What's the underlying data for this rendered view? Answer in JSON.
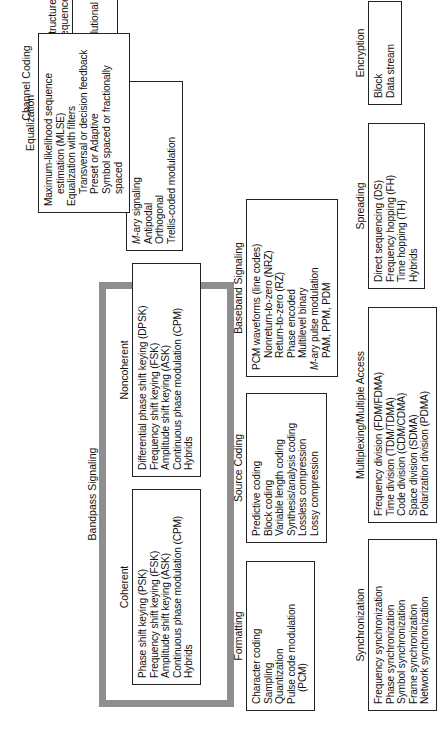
{
  "diagram": {
    "orientation": "rotated-90-ccw",
    "frame_color": "#8e8e8e",
    "box_border_color": "#222222",
    "background": "#ffffff",
    "groups": [
      {
        "id": "bandpass",
        "label": "Bandpass Signaling",
        "highlighted": true
      },
      {
        "id": "channel_coding",
        "label": "Channel Coding",
        "highlighted": false
      }
    ]
  },
  "sections": {
    "formatting": {
      "title": "Formatting",
      "items": [
        {
          "text": "Character coding",
          "indent": false
        },
        {
          "text": "Sampling",
          "indent": false
        },
        {
          "text": "Quantization",
          "indent": false
        },
        {
          "text": "Pulse code modulation",
          "indent": false
        },
        {
          "text": "(PCM)",
          "indent": true
        }
      ]
    },
    "source_coding": {
      "title": "Source Coding",
      "items": [
        {
          "text": "Predictive coding",
          "indent": false
        },
        {
          "text": "Block coding",
          "indent": false
        },
        {
          "text": "Variable length coding",
          "indent": false
        },
        {
          "text": "Synthesis/analysis coding",
          "indent": false
        },
        {
          "text": "Lossless compression",
          "indent": false
        },
        {
          "text": "Lossy compression",
          "indent": false
        }
      ]
    },
    "baseband_signaling": {
      "title": "Baseband Signaling",
      "items": [
        {
          "text": "PCM waveforms (line codes)",
          "indent": false
        },
        {
          "text": "Nonreturn-to-zero (NRZ)",
          "indent": true
        },
        {
          "text": "Return-to-zero (RZ)",
          "indent": true
        },
        {
          "text": "Phase encoded",
          "indent": true
        },
        {
          "text": "Multilevel binary",
          "indent": true
        },
        {
          "text": "M-ary pulse modulation",
          "indent": false,
          "italic_lead": "M"
        },
        {
          "text": "PAM, PPM, PDM",
          "indent": true
        }
      ]
    },
    "equalization": {
      "title": "Equalization",
      "items": [
        {
          "text": "Maximum-likelihood sequence",
          "indent": false
        },
        {
          "text": "estimation (MLSE)",
          "indent": true
        },
        {
          "text": "Equalization with filters",
          "indent": false
        },
        {
          "text": "Transversal or decision feedback",
          "indent": true
        },
        {
          "text": "Preset or Adaptive",
          "indent": true
        },
        {
          "text": "Symbol spaced or fractionally",
          "indent": true
        },
        {
          "text": "spaced",
          "indent": true
        }
      ]
    },
    "coherent": {
      "title": "Coherent",
      "items": [
        {
          "text": "Phase shift keying (PSK)",
          "indent": false
        },
        {
          "text": "Frequency shift keying (FSK)",
          "indent": false
        },
        {
          "text": "Amplitude shift keying (ASK)",
          "indent": false
        },
        {
          "text": "Continuous phase modulation (CPM)",
          "indent": false
        },
        {
          "text": "Hybrids",
          "indent": false
        }
      ]
    },
    "noncoherent": {
      "title": "Noncoherent",
      "items": [
        {
          "text": "Differential phase shift keying (DPSK)",
          "indent": false
        },
        {
          "text": "Frequency shift keying (FSK)",
          "indent": false
        },
        {
          "text": "Amplitude shift keying (ASK)",
          "indent": false
        },
        {
          "text": "Continuous phase modulation (CPM)",
          "indent": false
        },
        {
          "text": "Hybrids",
          "indent": false
        }
      ]
    },
    "waveform": {
      "title": "Waveform",
      "items": [
        {
          "text": "M-ary signaling",
          "indent": false,
          "italic_lead": "M"
        },
        {
          "text": "Antipodal",
          "indent": false
        },
        {
          "text": "Orthogonal",
          "indent": false
        },
        {
          "text": "Trellis-coded modulation",
          "indent": false
        }
      ]
    },
    "structured_sequences": {
      "title": "Structured\nSequences",
      "items": [
        {
          "text": "Block",
          "indent": false
        },
        {
          "text": "Convolutional",
          "indent": false
        },
        {
          "text": "Turbo",
          "indent": false
        }
      ]
    },
    "synchronization": {
      "title": "Synchronization",
      "items": [
        {
          "text": "Frequency synchronization",
          "indent": false
        },
        {
          "text": "Phase synchronization",
          "indent": false
        },
        {
          "text": "Symbol synchronization",
          "indent": false
        },
        {
          "text": "Frame synchronization",
          "indent": false
        },
        {
          "text": "Network synchronization",
          "indent": false
        }
      ]
    },
    "multiplexing": {
      "title": "Multiplexing/Multiple Access",
      "items": [
        {
          "text": "Frequency division (FDM/FDMA)",
          "indent": false
        },
        {
          "text": "Time division (TDM/TDMA)",
          "indent": false
        },
        {
          "text": "Code division (CDM/CDMA)",
          "indent": false
        },
        {
          "text": "Space division (SDMA)",
          "indent": false
        },
        {
          "text": "Polarization division (PDMA)",
          "indent": false
        }
      ]
    },
    "spreading": {
      "title": "Spreading",
      "items": [
        {
          "text": "Direct sequencing (DS)",
          "indent": false
        },
        {
          "text": "Frequency hopping (FH)",
          "indent": false
        },
        {
          "text": "Time hopping (TH)",
          "indent": false
        },
        {
          "text": "Hybrids",
          "indent": false
        }
      ]
    },
    "encryption": {
      "title": "Encryption",
      "items": [
        {
          "text": "Block",
          "indent": false
        },
        {
          "text": "Data stream",
          "indent": false
        }
      ]
    }
  },
  "group_titles": {
    "bandpass_signaling": "Bandpass Signaling",
    "channel_coding": "Channel Coding"
  }
}
